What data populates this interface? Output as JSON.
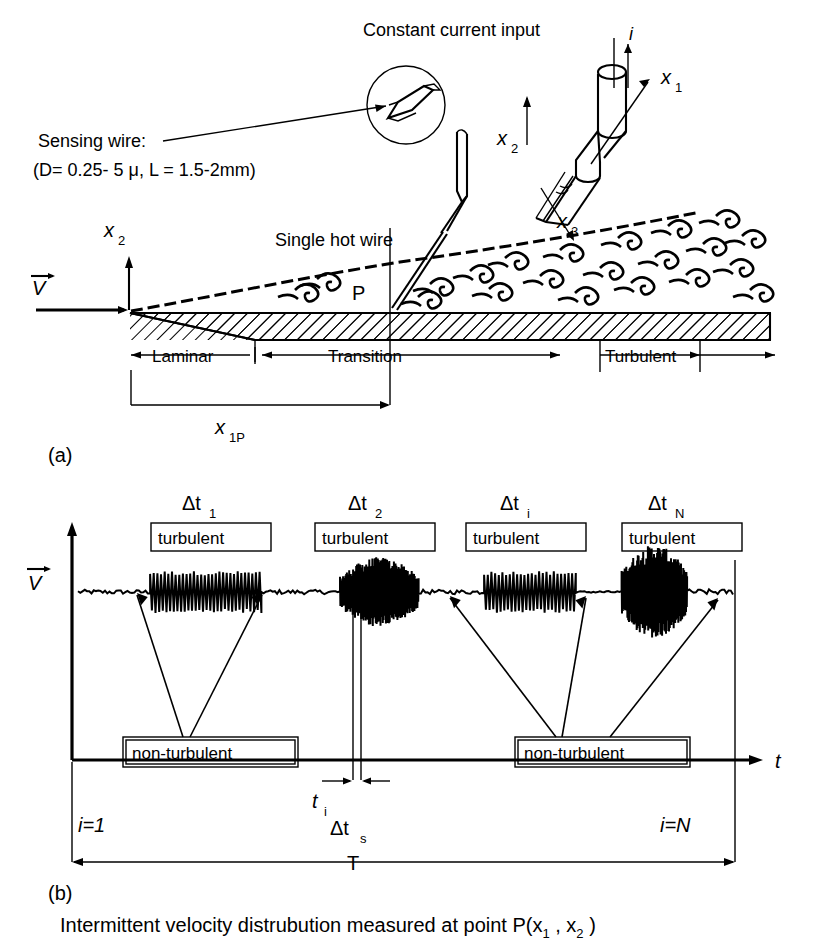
{
  "figure": {
    "panel_a": {
      "id": "(a)",
      "labels": {
        "constant_current_input": "Constant current input",
        "current_symbol": "i",
        "sensing_wire_line1": "Sensing wire:",
        "sensing_wire_line2": "(D= 0.25- 5 μ, L = 1.5-2mm)",
        "single_hot_wire": "Single hot wire",
        "point_p": "P",
        "velocity_vector": "V",
        "axis_x1": "x",
        "axis_x1_sub": "1",
        "axis_x2": "x",
        "axis_x2_sub": "2",
        "axis_x3": "x",
        "axis_x3_sub": "3",
        "axis_x2_flow": "x",
        "axis_x2_flow_sub": "2",
        "distance_x1p": "x",
        "distance_x1p_sub": "1P"
      },
      "regions": [
        {
          "name": "Laminar",
          "label": "Laminar"
        },
        {
          "name": "Transition",
          "label": "Transition"
        },
        {
          "name": "Turbulent",
          "label": "Turbulent"
        }
      ]
    },
    "panel_b": {
      "id": "(b)",
      "labels": {
        "velocity_vector": "V",
        "time_axis": "t",
        "t_i": "t",
        "t_i_sub": "i",
        "delta_t_s": "Δt",
        "delta_t_s_sub": "s",
        "period": "T",
        "i_first": "i=1",
        "i_last": "i=N"
      },
      "burst_labels": [
        {
          "delta": "Δt",
          "sub": "1",
          "box": "turbulent"
        },
        {
          "delta": "Δt",
          "sub": "2",
          "box": "turbulent"
        },
        {
          "delta": "Δt",
          "sub": "i",
          "box": "turbulent"
        },
        {
          "delta": "Δt",
          "sub": "N",
          "box": "turbulent"
        }
      ],
      "nonturbulent_labels": [
        "non-turbulent",
        "non-turbulent"
      ]
    },
    "caption": {
      "text_part1": "Intermittent velocity distrubution measured at point P(x",
      "sub1": "1",
      "text_part2": " , x",
      "sub2": "2",
      "text_part3": " )"
    }
  },
  "chart_data": {
    "type": "line",
    "xlabel": "t",
    "ylabel": "V",
    "grid": false,
    "legend": "none",
    "segments": [
      {
        "label": "non-turbulent",
        "type": "quiet",
        "x_start": 0.0,
        "x_end": 0.11,
        "amplitude": 0.04,
        "frequency": 24
      },
      {
        "label": "turbulent Δt1",
        "type": "burst",
        "x_start": 0.11,
        "x_end": 0.28,
        "amplitude": 0.42,
        "frequency": 22
      },
      {
        "label": "non-turbulent",
        "type": "quiet",
        "x_start": 0.28,
        "x_end": 0.4,
        "amplitude": 0.04,
        "frequency": 24
      },
      {
        "label": "turbulent Δt2",
        "type": "burst",
        "x_start": 0.4,
        "x_end": 0.52,
        "amplitude": 0.7,
        "frequency": 150
      },
      {
        "label": "non-turbulent",
        "type": "quiet",
        "x_start": 0.52,
        "x_end": 0.62,
        "amplitude": 0.04,
        "frequency": 24
      },
      {
        "label": "turbulent Δti",
        "type": "burst",
        "x_start": 0.62,
        "x_end": 0.76,
        "amplitude": 0.42,
        "frequency": 20
      },
      {
        "label": "non-turbulent",
        "type": "quiet",
        "x_start": 0.76,
        "x_end": 0.83,
        "amplitude": 0.02,
        "frequency": 10
      },
      {
        "label": "turbulent ΔtN",
        "type": "burst",
        "x_start": 0.83,
        "x_end": 0.93,
        "amplitude": 0.95,
        "frequency": 160
      },
      {
        "label": "non-turbulent",
        "type": "quiet",
        "x_start": 0.93,
        "x_end": 1.0,
        "amplitude": 0.05,
        "frequency": 26
      }
    ],
    "annotations": [
      {
        "name": "t_i",
        "x": 0.455
      },
      {
        "name": "Δt_s",
        "x_start": 0.425,
        "x_end": 0.487
      },
      {
        "name": "T",
        "x_start": 0.0,
        "x_end": 1.0
      }
    ],
    "boundary_layer_regions": {
      "categories": [
        "Laminar",
        "Transition",
        "Turbulent"
      ],
      "x_fractions": [
        0.0,
        0.3,
        0.78,
        1.0
      ]
    }
  }
}
